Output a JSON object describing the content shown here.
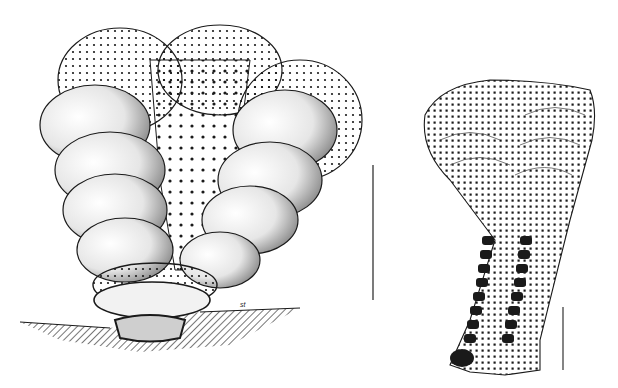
{
  "figure": {
    "specimens": [
      {
        "name": "left-specimen",
        "description": "Biserial fan-shaped test attached to substrate, pitted surface with overlapping chambers"
      },
      {
        "name": "right-specimen",
        "description": "Elongate flaring test with biserial darkened chambers in stalk"
      }
    ],
    "annotations": {
      "substrate_label": "st"
    },
    "scale_bars": [
      {
        "name": "left-scale-bar",
        "x": 373,
        "y1": 165,
        "y2": 300
      },
      {
        "name": "right-scale-bar",
        "x": 563,
        "y1": 307,
        "y2": 370
      }
    ],
    "colors": {
      "ink": "#1a1a1a",
      "paper": "#ffffff"
    }
  }
}
